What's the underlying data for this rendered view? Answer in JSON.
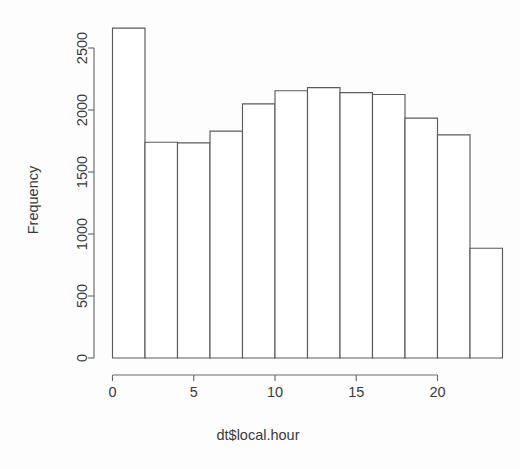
{
  "chart_data": {
    "type": "bar",
    "title": "",
    "subtitle": "",
    "xlabel": "dt$local.hour",
    "ylabel": "Frequency",
    "grid": false,
    "legend": false,
    "legend_position": "none",
    "bin_width": 2,
    "bin_edges": [
      0,
      2,
      4,
      6,
      8,
      10,
      12,
      14,
      16,
      18,
      20,
      22,
      24
    ],
    "categories": [
      "0-2",
      "2-4",
      "4-6",
      "6-8",
      "8-10",
      "10-12",
      "12-14",
      "14-16",
      "16-18",
      "18-20",
      "20-22",
      "22-24"
    ],
    "values": [
      2660,
      1740,
      1735,
      1830,
      2050,
      2155,
      2180,
      2140,
      2125,
      1935,
      1800,
      885
    ],
    "x": [
      1,
      3,
      5,
      7,
      9,
      11,
      13,
      15,
      17,
      19,
      21,
      23
    ],
    "xlim": [
      0,
      24
    ],
    "ylim": [
      0,
      2660
    ],
    "xticks": [
      0,
      5,
      10,
      15,
      20
    ],
    "xticklabels": [
      "0",
      "5",
      "10",
      "15",
      "20"
    ],
    "yticks": [
      0,
      500,
      1000,
      1500,
      2000,
      2500
    ],
    "yticklabels": [
      "0",
      "500",
      "1000",
      "1500",
      "2000",
      "2500"
    ],
    "bar_fill": "#ffffff",
    "bar_stroke": "#5a5a5a",
    "axis_color": "#6a6a6a",
    "text_color": "#3a3a3a",
    "background": "#fdfdfd"
  },
  "axes": {
    "y_title": "Frequency",
    "x_title": "dt$local.hour"
  }
}
